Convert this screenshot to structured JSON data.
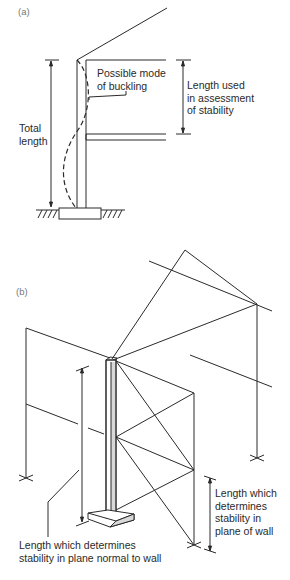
{
  "figure": {
    "panel_a": {
      "label": "(a)",
      "annotations": {
        "buckling": "Possible mode\nof buckling",
        "length_used": "Length used\nin assessment\nof stability",
        "total_length": "Total\nlength"
      }
    },
    "panel_b": {
      "label": "(b)",
      "annotations": {
        "normal_plane": "Length which determines\nstability in plane normal to wall",
        "wall_plane": "Length which\ndetermines\nstability in\nplane of wall"
      }
    },
    "colors": {
      "line": "#2a2a2a",
      "background": "#ffffff",
      "shade": "#d8d8d8"
    }
  }
}
